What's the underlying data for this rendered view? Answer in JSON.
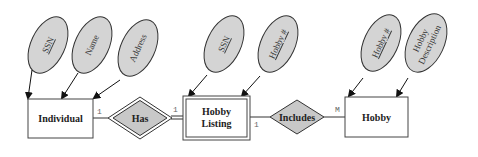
{
  "diagram": {
    "type": "entity-relationship",
    "colors": {
      "attribute_fill": "#d4d4d4",
      "relationship_fill": "#c8c8c8",
      "entity_fill": "#ffffff",
      "stroke": "#333333"
    },
    "entities": [
      {
        "id": "individual",
        "label": "Individual",
        "weak": false
      },
      {
        "id": "hobby_listing",
        "label_line1": "Hobby",
        "label_line2": "Listing",
        "weak": true
      },
      {
        "id": "hobby",
        "label": "Hobby",
        "weak": false
      }
    ],
    "relationships": [
      {
        "id": "has",
        "label": "Has",
        "identifying": true,
        "card_left": "1",
        "card_right": "1"
      },
      {
        "id": "includes",
        "label": "Includes",
        "identifying": false,
        "card_left": "1",
        "card_right": "M"
      }
    ],
    "attributes": [
      {
        "entity": "individual",
        "label": "SSN",
        "key": true
      },
      {
        "entity": "individual",
        "label": "Name",
        "key": false
      },
      {
        "entity": "individual",
        "label": "Address",
        "key": false
      },
      {
        "entity": "hobby_listing",
        "label": "SSN",
        "key": true
      },
      {
        "entity": "hobby_listing",
        "label": "Hobby #",
        "key": true
      },
      {
        "entity": "hobby",
        "label": "Hobby #",
        "key": true
      },
      {
        "entity": "hobby",
        "label_line1": "Hobby",
        "label_line2": "Description",
        "key": false
      }
    ]
  }
}
